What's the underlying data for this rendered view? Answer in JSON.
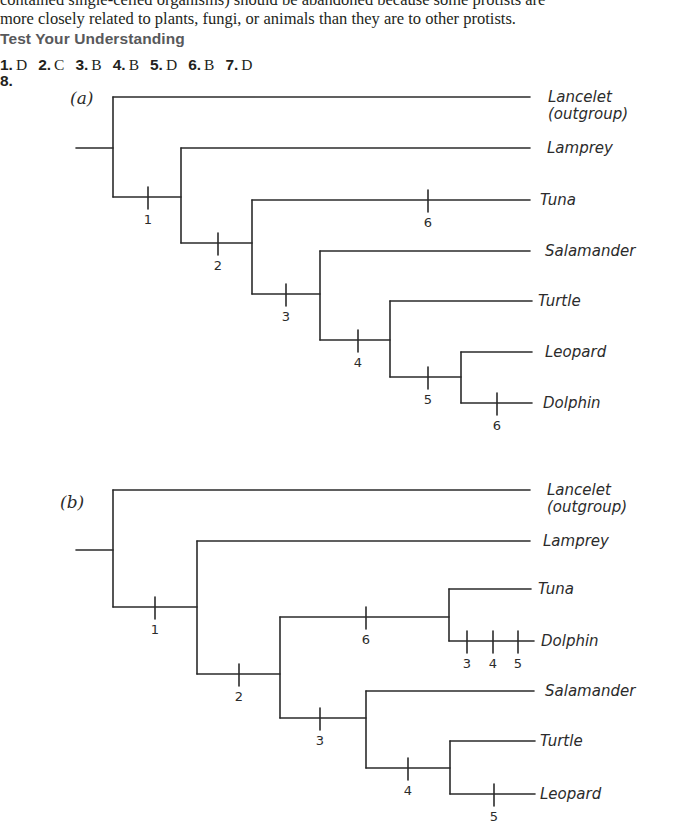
{
  "prose": {
    "line1": "contained single-celled organisms) should be abandoned because some protists are",
    "line2": "more closely related to plants, fungi, or animals than they are to other protists."
  },
  "section": {
    "heading": "Test Your Understanding"
  },
  "answers": [
    {
      "num": "1.",
      "val": "D"
    },
    {
      "num": "2.",
      "val": "C"
    },
    {
      "num": "3.",
      "val": "B"
    },
    {
      "num": "4.",
      "val": "B"
    },
    {
      "num": "5.",
      "val": "D"
    },
    {
      "num": "6.",
      "val": "B"
    },
    {
      "num": "7.",
      "val": "D"
    }
  ],
  "question8": {
    "num": "8.",
    "trees": [
      {
        "panel_label": "(a)",
        "panel_pos": [
          70,
          104
        ],
        "taxa": [
          {
            "name": "Lancelet",
            "sub": "(outgroup)",
            "y": 97,
            "x_end": 530,
            "label_x": 548
          },
          {
            "name": "Lamprey",
            "y": 148,
            "x_end": 530,
            "label_x": 547
          },
          {
            "name": "Tuna",
            "y": 200,
            "x_end": 530,
            "label_x": 540
          },
          {
            "name": "Salamander",
            "y": 251,
            "x_end": 530,
            "label_x": 545
          },
          {
            "name": "Turtle",
            "y": 301,
            "x_end": 532,
            "label_x": 538
          },
          {
            "name": "Leopard",
            "y": 352,
            "x_end": 532,
            "label_x": 545
          },
          {
            "name": "Dolphin",
            "y": 403,
            "x_end": 532,
            "label_x": 543
          }
        ],
        "lines": [
          [
            76,
            148,
            113,
            148
          ],
          [
            113,
            97,
            113,
            197
          ],
          [
            113,
            97,
            530,
            97
          ],
          [
            113,
            197,
            181,
            197
          ],
          [
            181,
            148,
            181,
            243
          ],
          [
            181,
            148,
            530,
            148
          ],
          [
            181,
            243,
            252,
            243
          ],
          [
            252,
            200,
            252,
            294
          ],
          [
            252,
            200,
            530,
            200
          ],
          [
            252,
            294,
            320,
            294
          ],
          [
            320,
            251,
            320,
            340
          ],
          [
            320,
            251,
            530,
            251
          ],
          [
            320,
            340,
            390,
            340
          ],
          [
            390,
            301,
            390,
            377
          ],
          [
            390,
            301,
            532,
            301
          ],
          [
            390,
            377,
            461,
            377
          ],
          [
            461,
            352,
            461,
            403
          ],
          [
            461,
            352,
            532,
            352
          ],
          [
            461,
            403,
            532,
            403
          ]
        ],
        "ticks": [
          {
            "x": 148,
            "y": 197,
            "label": "1"
          },
          {
            "x": 218,
            "y": 243,
            "label": "2"
          },
          {
            "x": 428,
            "y": 200,
            "label": "6"
          },
          {
            "x": 286,
            "y": 294,
            "label": "3"
          },
          {
            "x": 358,
            "y": 340,
            "label": "4"
          },
          {
            "x": 428,
            "y": 377,
            "label": "5"
          },
          {
            "x": 497,
            "y": 403,
            "label": "6"
          }
        ]
      },
      {
        "panel_label": "(b)",
        "panel_pos": [
          60,
          508
        ],
        "taxa": [
          {
            "name": "Lancelet",
            "sub": "(outgroup)",
            "y": 490,
            "x_end": 530,
            "label_x": 547
          },
          {
            "name": "Lamprey",
            "y": 541,
            "x_end": 530,
            "label_x": 543
          },
          {
            "name": "Tuna",
            "y": 589,
            "x_end": 531,
            "label_x": 538
          },
          {
            "name": "Dolphin",
            "y": 641,
            "x_end": 534,
            "label_x": 541
          },
          {
            "name": "Salamander",
            "y": 691,
            "x_end": 534,
            "label_x": 545
          },
          {
            "name": "Turtle",
            "y": 741,
            "x_end": 535,
            "label_x": 540
          },
          {
            "name": "Leopard",
            "y": 794,
            "x_end": 535,
            "label_x": 540
          }
        ],
        "lines": [
          [
            76,
            550,
            113,
            550
          ],
          [
            113,
            490,
            113,
            607
          ],
          [
            113,
            490,
            530,
            490
          ],
          [
            113,
            607,
            197,
            607
          ],
          [
            197,
            541,
            197,
            674
          ],
          [
            197,
            541,
            530,
            541
          ],
          [
            197,
            674,
            280,
            674
          ],
          [
            280,
            617,
            280,
            718
          ],
          [
            280,
            617,
            449,
            617
          ],
          [
            449,
            589,
            449,
            641
          ],
          [
            449,
            589,
            531,
            589
          ],
          [
            449,
            641,
            534,
            641
          ],
          [
            280,
            718,
            366,
            718
          ],
          [
            366,
            691,
            366,
            768
          ],
          [
            366,
            691,
            534,
            691
          ],
          [
            366,
            768,
            450,
            768
          ],
          [
            450,
            741,
            450,
            794
          ],
          [
            450,
            741,
            535,
            741
          ],
          [
            450,
            794,
            535,
            794
          ]
        ],
        "ticks": [
          {
            "x": 155,
            "y": 607,
            "label": "1"
          },
          {
            "x": 239,
            "y": 674,
            "label": "2"
          },
          {
            "x": 366,
            "y": 617,
            "label": "6"
          },
          {
            "x": 467,
            "y": 641,
            "label": "3"
          },
          {
            "x": 493,
            "y": 641,
            "label": "4"
          },
          {
            "x": 518,
            "y": 641,
            "label": "5"
          },
          {
            "x": 320,
            "y": 718,
            "label": "3"
          },
          {
            "x": 408,
            "y": 768,
            "label": "4"
          },
          {
            "x": 494,
            "y": 794,
            "label": "5"
          }
        ]
      }
    ]
  }
}
